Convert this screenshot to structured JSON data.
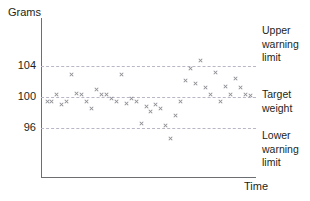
{
  "chart_data": {
    "type": "scatter",
    "title": "",
    "xlabel": "Time",
    "ylabel": "Grams",
    "ylim": [
      92,
      106.5
    ],
    "yticks": [
      96,
      100,
      104
    ],
    "ytick_labels": [
      "96",
      "100",
      "104"
    ],
    "grid": true,
    "gridlines": [
      {
        "value": 104,
        "label": "Upper warning limit"
      },
      {
        "value": 100,
        "label": "Target weight"
      },
      {
        "value": 96,
        "label": "Lower warning limit"
      }
    ],
    "legend": "none",
    "marker": "x",
    "marker_color": "#8e8e96",
    "series": [
      {
        "name": "Weight measurements",
        "x": [
          1,
          2,
          3,
          4,
          5,
          6,
          7,
          8,
          9,
          10,
          11,
          12,
          13,
          14,
          15,
          16,
          17,
          18,
          19,
          20,
          21,
          22,
          23,
          24,
          25,
          26,
          27,
          28,
          29,
          30,
          31,
          32,
          33,
          34,
          35,
          36,
          37,
          38,
          39,
          40,
          41,
          42
        ],
        "y": [
          99.3,
          99.4,
          100.3,
          99.0,
          99.4,
          102.8,
          100.4,
          100.2,
          99.4,
          98.5,
          100.9,
          100.2,
          100.3,
          99.8,
          99.4,
          102.8,
          99.1,
          99.8,
          99.3,
          96.5,
          98.7,
          98.1,
          99.0,
          98.4,
          96.3,
          94.6,
          97.5,
          99.4,
          102.1,
          103.6,
          101.7,
          104.6,
          101.2,
          100.2,
          103.1,
          99.4,
          101.3,
          100.3,
          102.3,
          101.2,
          100.2,
          100.1
        ]
      }
    ]
  },
  "axis_titles": {
    "y": "Grams",
    "x": "Time"
  },
  "tick_labels": {
    "upper": "104",
    "middle": "100",
    "lower": "96"
  },
  "annotations": {
    "upper_limit": "Upper\nwarning\nlimit",
    "target": "Target\nweight",
    "lower_limit": "Lower\nwarning\nlimit"
  },
  "colors": {
    "axis": "#6d6e71",
    "gridline": "#b9b6c6",
    "marker": "#8e8e96",
    "text": "#231f20"
  }
}
